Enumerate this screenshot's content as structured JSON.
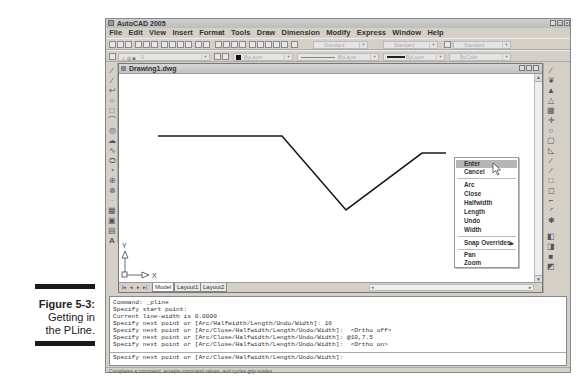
{
  "caption": {
    "figure": "Figure 5-3:",
    "line1": "Getting in",
    "line2": "the PLine."
  },
  "window": {
    "title": "AutoCAD 2005",
    "controls": [
      "minimize",
      "maximize",
      "close"
    ]
  },
  "menu": {
    "items": [
      "File",
      "Edit",
      "View",
      "Insert",
      "Format",
      "Tools",
      "Draw",
      "Dimension",
      "Modify",
      "Express",
      "Window",
      "Help"
    ]
  },
  "toolbars": {
    "row1_dropdowns": [
      {
        "name": "text-style",
        "value": "Standard"
      },
      {
        "name": "dim-style",
        "value": "Standard"
      },
      {
        "name": "table-style",
        "value": "Standard"
      }
    ],
    "row2_dropdowns": [
      {
        "name": "layer",
        "value": "0"
      },
      {
        "name": "color",
        "value": "ByLayer"
      },
      {
        "name": "linetype",
        "value": "ByLayer"
      },
      {
        "name": "lineweight",
        "value": "ByLayer"
      },
      {
        "name": "plot-style",
        "value": "ByColor"
      }
    ]
  },
  "drawing": {
    "title": "Drawing1.dwg",
    "ucs": {
      "x_label": "X",
      "y_label": "Y"
    },
    "polyline_points": [
      [
        158,
        136
      ],
      [
        282,
        136
      ],
      [
        346,
        210
      ],
      [
        422,
        153
      ],
      [
        446,
        153
      ]
    ],
    "tabs": [
      "Model",
      "Layout1",
      "Layout2"
    ],
    "active_tab": "Model"
  },
  "context_menu": {
    "items": [
      {
        "label": "Enter",
        "highlighted": true
      },
      {
        "label": "Cancel"
      },
      {
        "separator": true
      },
      {
        "label": "Arc"
      },
      {
        "label": "Close"
      },
      {
        "label": "Halfwidth"
      },
      {
        "label": "Length"
      },
      {
        "label": "Undo"
      },
      {
        "label": "Width"
      },
      {
        "separator": true
      },
      {
        "label": "Snap Overrides",
        "submenu": true
      },
      {
        "separator": true
      },
      {
        "label": "Pan"
      },
      {
        "label": "Zoom"
      }
    ]
  },
  "command_window": {
    "lines": [
      "Command: _pline",
      "Specify start point:",
      "Current line-width is 0.0000",
      "Specify next point or [Arc/Halfwidth/Length/Undo/Width]: 16",
      "Specify next point or [Arc/Close/Halfwidth/Length/Undo/Width]:  <Ortho off>",
      "Specify next point or [Arc/Close/Halfwidth/Length/Undo/Width]: @10,7.5",
      "Specify next point or [Arc/Close/Halfwidth/Length/Undo/Width]:  <Ortho on>"
    ],
    "prompt": "Specify next point or [Arc/Close/Halfwidth/Length/Undo/Width]:"
  },
  "status_bar": {
    "text": "Completes a command, accepts command values, and cycles grip modes"
  }
}
